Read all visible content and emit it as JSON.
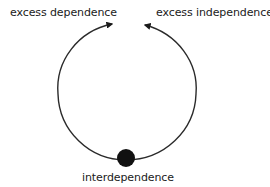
{
  "diagram": {
    "type": "cycle",
    "labels": {
      "top_left": "excess dependence",
      "top_right": "excess independence",
      "bottom": "interdependence"
    },
    "colors": {
      "line": "#2a2a2a",
      "dot": "#111111",
      "text": "#1a1a1a",
      "background": "#ffffff"
    }
  }
}
